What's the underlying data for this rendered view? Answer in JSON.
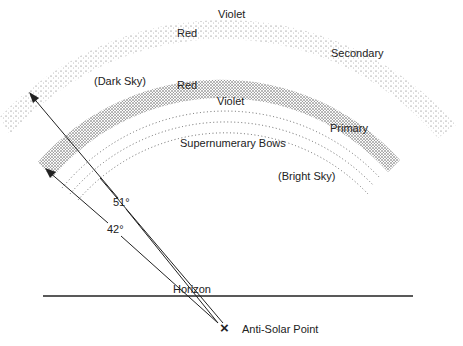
{
  "diagram": {
    "type": "rainbow-geometry",
    "colors": {
      "ink": "#222222",
      "band": "#3a3a3a",
      "background": "#ffffff"
    },
    "labels": {
      "secondary_violet": "Violet",
      "secondary_red": "Red",
      "secondary": "Secondary",
      "dark_sky": "(Dark Sky)",
      "primary_red": "Red",
      "primary_violet": "Violet",
      "primary": "Primary",
      "supernumerary": "Supernumerary Bows",
      "bright_sky": "(Bright Sky)",
      "angle_51": "51°",
      "angle_42": "42°",
      "horizon": "Horizon",
      "anti_solar_point": "Anti-Solar Point",
      "anti_solar_marker": "×"
    },
    "angles": {
      "primary_deg": 42,
      "secondary_deg": 51
    }
  }
}
